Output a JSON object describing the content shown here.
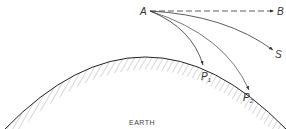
{
  "diagram": {
    "labels": {
      "A": "A",
      "B": "B",
      "S": "S",
      "P1": "P",
      "P1_sub": "1",
      "P2": "P",
      "P2_sub": "2",
      "earth": "EARTH"
    },
    "colors": {
      "line": "#333333",
      "hatch": "#9a9a9a",
      "background": "#ffffff"
    }
  }
}
